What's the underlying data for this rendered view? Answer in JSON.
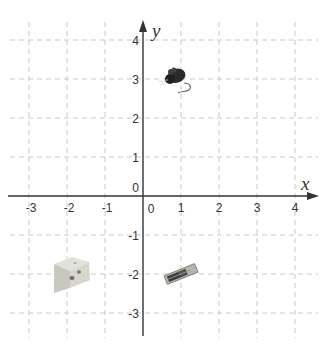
{
  "diagram": {
    "type": "coordinate-plane",
    "axes": {
      "x_label": "x",
      "y_label": "y",
      "x_range": [
        -3,
        4
      ],
      "y_range": [
        -3,
        4
      ],
      "origin_label_y": "0",
      "origin_label_x": "0"
    },
    "x_ticks": [
      "-3",
      "-2",
      "-1",
      "1",
      "2",
      "3",
      "4"
    ],
    "y_ticks": [
      "4",
      "3",
      "2",
      "1",
      "-1",
      "-2",
      "-3"
    ],
    "grid": {
      "style": "dashed",
      "color": "#c8c8c8"
    },
    "objects": [
      {
        "name": "mouse",
        "x": 1,
        "y": 3
      },
      {
        "name": "cheese",
        "x": -2,
        "y": -2
      },
      {
        "name": "mousetrap",
        "x": 1,
        "y": -2
      }
    ]
  }
}
